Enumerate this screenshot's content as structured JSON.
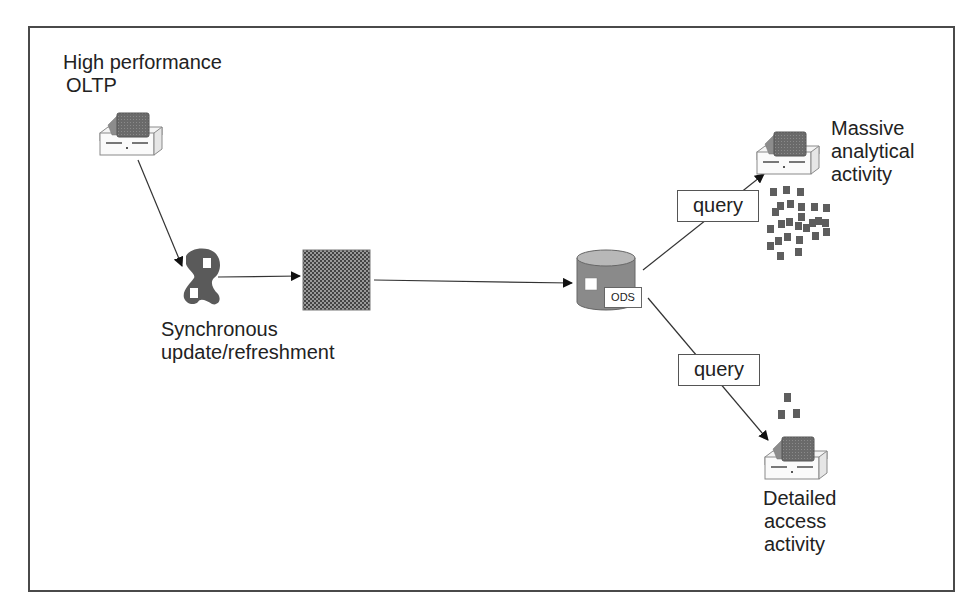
{
  "diagram": {
    "nodes": {
      "oltp": {
        "label_line1": "High performance",
        "label_line2": "OLTP",
        "icon": "computer-icon"
      },
      "sync": {
        "label_line1": "Synchronous",
        "label_line2": "update/refreshment",
        "icon": "transform-shape-icon"
      },
      "staging": {
        "icon": "checkered-box-icon"
      },
      "ods": {
        "label": "ODS",
        "icon": "database-cylinder-icon"
      },
      "analytical": {
        "label_line1": "Massive",
        "label_line2": "analytical",
        "label_line3": "activity",
        "icon": "computer-icon"
      },
      "detailed": {
        "label_line1": "Detailed",
        "label_line2": "access",
        "label_line3": "activity",
        "icon": "computer-icon"
      }
    },
    "edges": [
      {
        "from": "oltp",
        "to": "sync",
        "label": ""
      },
      {
        "from": "sync",
        "to": "staging",
        "label": ""
      },
      {
        "from": "staging",
        "to": "ods",
        "label": ""
      },
      {
        "from": "ods",
        "to": "analytical",
        "label": "query"
      },
      {
        "from": "ods",
        "to": "detailed",
        "label": "query"
      }
    ],
    "colors": {
      "icon_fill": "#6e6e6e",
      "icon_dark": "#4a4a4a",
      "line": "#333333",
      "frame": "#4a4a4a"
    }
  }
}
